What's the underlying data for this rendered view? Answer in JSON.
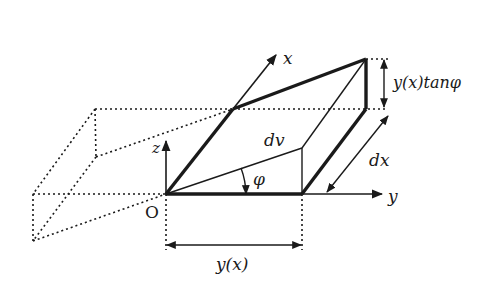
{
  "figure": {
    "labels": {
      "x_axis": "x",
      "y_axis": "y",
      "z_axis": "z",
      "origin": "O",
      "volume_element": "dv",
      "angle": "φ",
      "thickness": "dx",
      "height": "y(x)tanφ",
      "base_width": "y(x)"
    },
    "colors": {
      "line": "#1a1a1a",
      "background": "#ffffff"
    }
  }
}
